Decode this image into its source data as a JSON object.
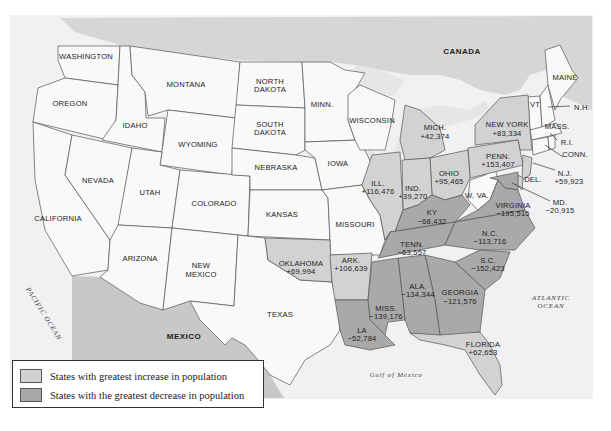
{
  "colors": {
    "background": "#ffffff",
    "frame": "#ededed",
    "canada": "#d6d6d6",
    "water": "#f2f2f2",
    "lakes": "#e4e4e4",
    "mexico": "#c8c8c8",
    "neutral_state": "#f9f9f9",
    "increase": "#d2d2d2",
    "decrease": "#a9a9a9",
    "florida": "#cfcfcf"
  },
  "labels": {
    "canada": "CANADA",
    "mexico": "MEXICO",
    "pacific": "PACIFIC OCEAN",
    "atlantic_1": "ATLANTIC",
    "atlantic_2": "OCEAN",
    "gulf": "Gulf of Mexico"
  },
  "states": {
    "washington": "WASHINGTON",
    "oregon": "OREGON",
    "california": "CALIFORNIA",
    "idaho": "IDAHO",
    "nevada": "NEVADA",
    "montana": "MONTANA",
    "wyoming": "WYOMING",
    "utah": "UTAH",
    "arizona": "ARIZONA",
    "colorado": "COLORADO",
    "new_mexico_1": "NEW",
    "new_mexico_2": "MEXICO",
    "north_dakota_1": "NORTH",
    "north_dakota_2": "DAKOTA",
    "south_dakota_1": "SOUTH",
    "south_dakota_2": "DAKOTA",
    "nebraska": "NEBRASKA",
    "kansas": "KANSAS",
    "texas": "TEXAS",
    "minn": "MINN.",
    "iowa": "IOWA",
    "missouri": "MISSOURI",
    "wisconsin": "WISCONSIN",
    "wva": "W. VA.",
    "maine": "MAINE",
    "vt": "VT",
    "nh": "N.H.",
    "mass": "MASS.",
    "ri": "R.I.",
    "conn": "CONN."
  },
  "changes": [
    {
      "state": "MICH.",
      "value": "+42,374",
      "type": "increase"
    },
    {
      "state": "NEW YORK",
      "value": "+83,334",
      "type": "increase"
    },
    {
      "state": "PENN.",
      "value": "+153,407",
      "type": "increase"
    },
    {
      "state": "OHIO",
      "value": "+95,465",
      "type": "increase"
    },
    {
      "state": "IND.",
      "value": "+39,270",
      "type": "increase"
    },
    {
      "state": "ILL.",
      "value": "+116,476",
      "type": "increase"
    },
    {
      "state": "N.J.",
      "value": "+59,923",
      "type": "increase"
    },
    {
      "state": "DEL.",
      "value": "",
      "type": "increase"
    },
    {
      "state": "MD.",
      "value": "−20,915",
      "type": "decrease"
    },
    {
      "state": "VIRGINIA",
      "value": "−195,515",
      "type": "decrease"
    },
    {
      "state": "KY",
      "value": "−68,432",
      "type": "decrease"
    },
    {
      "state": "TENN.",
      "value": "−63,557",
      "type": "decrease"
    },
    {
      "state": "N.C.",
      "value": "−113,716",
      "type": "decrease"
    },
    {
      "state": "S.C.",
      "value": "−152,423",
      "type": "decrease"
    },
    {
      "state": "GEORGIA",
      "value": "−121,576",
      "type": "decrease"
    },
    {
      "state": "ALA.",
      "value": "−134,344",
      "type": "decrease"
    },
    {
      "state": "MISS.",
      "value": "−139,176",
      "type": "decrease"
    },
    {
      "state": "LA",
      "value": "−52,784",
      "type": "decrease"
    },
    {
      "state": "ARK.",
      "value": "+106,639",
      "type": "increase"
    },
    {
      "state": "OKLAHOMA",
      "value": "+69,994",
      "type": "increase"
    },
    {
      "state": "FLORIDA",
      "value": "+62,653",
      "type": "increase"
    }
  ],
  "legend": {
    "items": [
      {
        "label": "States with greatest increase in population",
        "color": "#d2d2d2"
      },
      {
        "label": "States with the greatest decrease in population",
        "color": "#a9a9a9"
      }
    ]
  }
}
